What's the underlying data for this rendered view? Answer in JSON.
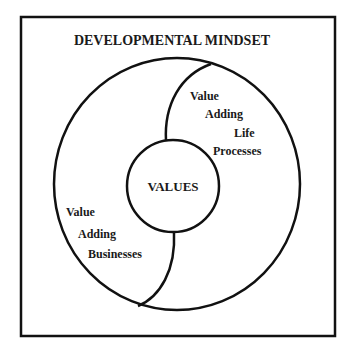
{
  "title": "DEVELOPMENTAL MINDSET",
  "center": {
    "label": "VALUES"
  },
  "upper_right_region": {
    "lines": [
      "Value",
      "Adding",
      "Life",
      "Processes"
    ]
  },
  "lower_left_region": {
    "lines": [
      "Value",
      "Adding",
      "Businesses"
    ]
  },
  "colors": {
    "stroke": "#111111",
    "background": "#ffffff"
  }
}
